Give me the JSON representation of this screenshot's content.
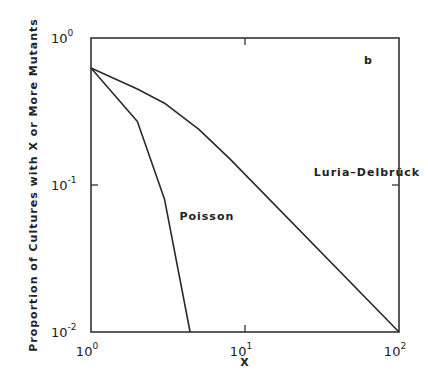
{
  "chart_data": {
    "type": "line",
    "title": "",
    "panel_label": "b",
    "xlabel": "X",
    "ylabel": "Proportion of Cultures with X or More Mutants",
    "xscale": "log",
    "yscale": "log",
    "xlim": [
      1,
      100
    ],
    "ylim": [
      0.01,
      1
    ],
    "x_ticks": [
      {
        "value": 1,
        "base": "10",
        "exp": "0"
      },
      {
        "value": 10,
        "base": "10",
        "exp": "1"
      },
      {
        "value": 100,
        "base": "10",
        "exp": "2"
      }
    ],
    "y_ticks": [
      {
        "value": 1,
        "base": "10",
        "exp": "0"
      },
      {
        "value": 0.1,
        "base": "10",
        "exp": "-1"
      },
      {
        "value": 0.01,
        "base": "10",
        "exp": "-2"
      }
    ],
    "grid": false,
    "legend": "none (inline annotations)",
    "series": [
      {
        "name": "Luria-Delbrück",
        "label": "Luria–Delbrück",
        "x": [
          1,
          2,
          3,
          5,
          8,
          100
        ],
        "y": [
          0.625,
          0.45,
          0.36,
          0.24,
          0.15,
          0.01
        ],
        "label_pos": {
          "x": 28,
          "y": 0.115
        }
      },
      {
        "name": "Poisson",
        "label": "Poisson",
        "x": [
          1,
          2,
          3,
          4.4
        ],
        "y": [
          0.625,
          0.27,
          0.08,
          0.01
        ],
        "label_pos": {
          "x": 3.75,
          "y": 0.058
        }
      }
    ],
    "color": "#2a2a2a"
  }
}
